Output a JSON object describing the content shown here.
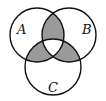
{
  "diagram": {
    "type": "venn",
    "sets": [
      {
        "label": "A",
        "cx": 37,
        "cy": 35,
        "r": 27,
        "label_x": 20,
        "label_y": 33
      },
      {
        "label": "B",
        "cx": 69,
        "cy": 35,
        "r": 27,
        "label_x": 84,
        "label_y": 33
      },
      {
        "label": "C",
        "cx": 53,
        "cy": 67,
        "r": 28,
        "label_x": 49,
        "label_y": 92
      }
    ],
    "shaded_regions": [
      "A∩B only",
      "A∩C only",
      "B∩C only"
    ],
    "unshaded_regions": [
      "A only",
      "B only",
      "C only",
      "A∩B∩C"
    ],
    "colors": {
      "shade": "#9a9a9a",
      "stroke": "#111111",
      "background": "#ffffff"
    }
  }
}
